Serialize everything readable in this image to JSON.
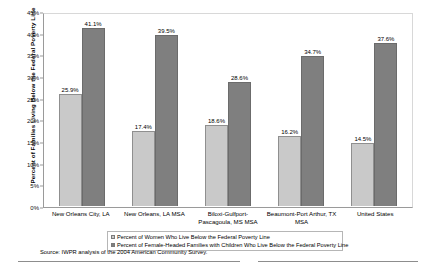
{
  "chart_data": {
    "type": "bar",
    "title": "",
    "xlabel": "",
    "ylabel": "Percent of Families Living Below the Federal Poverty Line",
    "ylim": [
      0,
      45
    ],
    "ytick_labels": [
      "0%",
      "5%",
      "10%",
      "15%",
      "20%",
      "25%",
      "30%",
      "35%",
      "40%",
      "45%"
    ],
    "ytick_values": [
      0,
      5,
      10,
      15,
      20,
      25,
      30,
      35,
      40,
      45
    ],
    "grid": false,
    "legend_position": "bottom",
    "categories": [
      "New Orleans City, LA",
      "New Orleans, LA MSA",
      "Biloxi-Gulfport-Pascagoula, MS MSA",
      "Beaumont-Port Arthur, TX MSA",
      "United States"
    ],
    "series": [
      {
        "name": "Percent of Women Who Live Below the Federal Poverty Line",
        "color": "#C9C9C9",
        "values": [
          25.9,
          17.4,
          18.6,
          16.2,
          14.5
        ],
        "value_labels": [
          "25.9%",
          "17.4%",
          "18.6%",
          "16.2%",
          "14.5%"
        ]
      },
      {
        "name": "Percent of Female-Headed Families with Children Who Live Below the Federal Poverty Line",
        "color": "#7F7F7F",
        "values": [
          41.1,
          39.5,
          28.6,
          34.7,
          37.6
        ],
        "value_labels": [
          "41.1%",
          "39.5%",
          "28.6%",
          "34.7%",
          "37.6%"
        ]
      }
    ],
    "source_note": "Source: IWPR analysis of the 2004 American Community Survey."
  },
  "legend": {
    "items": [
      {
        "label": "Percent of Women Who Live Below the Federal Poverty Line"
      },
      {
        "label": "Percent of Female-Headed Families with Children Who Live Below the Federal Poverty Line"
      }
    ]
  }
}
